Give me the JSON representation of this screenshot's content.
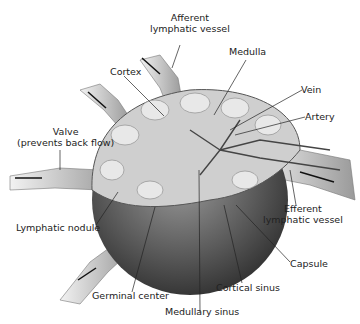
{
  "diagram": {
    "labels": {
      "afferent_lymphatic_vessel_line1": "Afferent",
      "afferent_lymphatic_vessel_line2": "lymphatic vessel",
      "medulla": "Medulla",
      "cortex": "Cortex",
      "vein": "Vein",
      "artery": "Artery",
      "valve_line1": "Valve",
      "valve_line2": "(prevents back flow)",
      "efferent_lymphatic_vessel_line1": "Efferent",
      "efferent_lymphatic_vessel_line2": "lymphatic vessel",
      "lymphatic_nodule": "Lymphatic nodule",
      "capsule": "Capsule",
      "germinal_center": "Germinal center",
      "cortical_sinus": "Cortical sinus",
      "medullary_sinus": "Medullary sinus"
    },
    "colors": {
      "tissue_light": "#cfcfcf",
      "tissue_dark": "#4a4a4a",
      "vessel": "#bdbdbd",
      "line": "#333333"
    }
  }
}
